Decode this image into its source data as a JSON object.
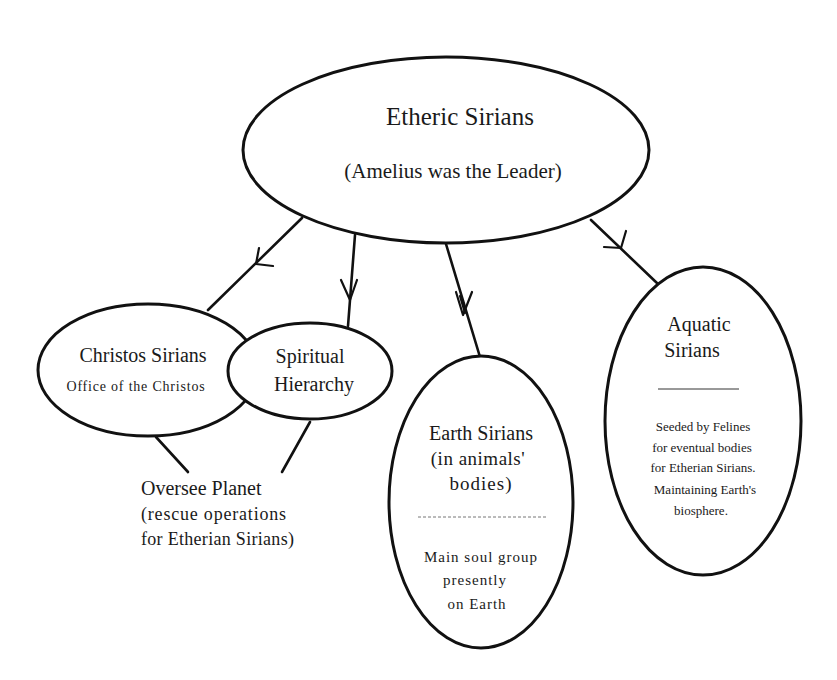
{
  "diagram": {
    "nodes": {
      "etheric": {
        "title": "Etheric Sirians",
        "subtitle": "(Amelius was the Leader)"
      },
      "christos": {
        "title": "Christos Sirians",
        "subtitle": "Office of the Christos"
      },
      "spiritual": {
        "line1": "Spiritual",
        "line2": "Hierarchy"
      },
      "earth": {
        "line1": "Earth Sirians",
        "line2": "(in animals'",
        "line3": "bodies)",
        "desc1": "Main soul group",
        "desc2": "presently",
        "desc3": "on Earth"
      },
      "aquatic": {
        "line1": "Aquatic",
        "line2": "Sirians",
        "desc1": "Seeded by Felines",
        "desc2": "for eventual bodies",
        "desc3": "for Etherian Sirians.",
        "desc4": "Maintaining Earth's",
        "desc5": "biosphere."
      },
      "oversee": {
        "line1": "Oversee Planet",
        "line2": "(rescue operations",
        "line3": "for Etherian Sirians)"
      }
    },
    "edges": [
      {
        "from": "Etheric Sirians",
        "to": "Christos Sirians",
        "arrow": true
      },
      {
        "from": "Etheric Sirians",
        "to": "Spiritual Hierarchy",
        "arrow": true
      },
      {
        "from": "Etheric Sirians",
        "to": "Earth Sirians",
        "arrow": true
      },
      {
        "from": "Etheric Sirians",
        "to": "Aquatic Sirians",
        "arrow": true
      },
      {
        "from": "Christos Sirians",
        "to": "Oversee Planet",
        "arrow": false
      },
      {
        "from": "Spiritual Hierarchy",
        "to": "Oversee Planet",
        "arrow": false
      }
    ],
    "colors": {
      "stroke": "#111111",
      "background": "#ffffff",
      "text": "#1a1a1a"
    }
  }
}
